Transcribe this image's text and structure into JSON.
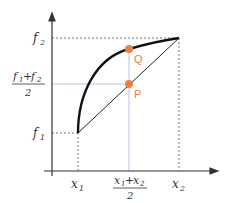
{
  "diagram": {
    "y_labels": {
      "f2": "f",
      "f2_sub": "2",
      "mid_num_a": "f",
      "mid_num_a_sub": "1",
      "mid_plus": "+",
      "mid_num_b": "f",
      "mid_num_b_sub": "2",
      "mid_den": "2",
      "f1": "f",
      "f1_sub": "1"
    },
    "x_labels": {
      "x1": "x",
      "x1_sub": "1",
      "mid_num_a": "x",
      "mid_num_a_sub": "1",
      "mid_plus": "+",
      "mid_num_b": "x",
      "mid_num_b_sub": "2",
      "mid_den": "2",
      "x2": "x",
      "x2_sub": "2"
    },
    "points": {
      "Q": "Q",
      "P": "P"
    },
    "colors": {
      "axis": "#333333",
      "curve": "#111111",
      "point": "#f08040",
      "guide": "#b8c4e8",
      "dashed": "#555555"
    }
  }
}
